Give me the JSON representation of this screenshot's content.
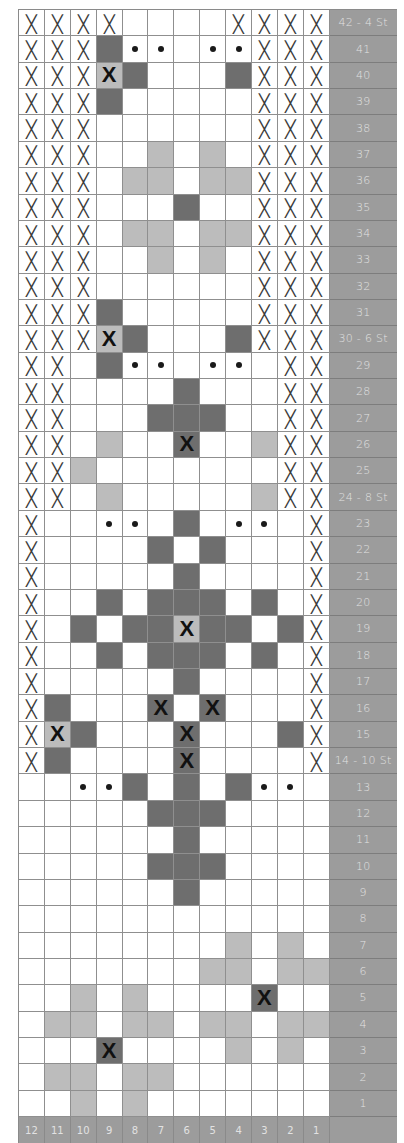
{
  "legend_key": {
    ".": "empty",
    "X": "no-stitch",
    "D": "dark-stitch",
    "L": "light-stitch",
    "o": "dot-stitch",
    "K": "light-stitch-bold-x",
    "B": "dark-stitch-bold-x"
  },
  "colors": {
    "dark": "#6e6e6e",
    "light": "#bcbcbc",
    "label_bg": "#9c9c9c",
    "label_text": "#e2e2e2",
    "grid_line": "#8f8f8f"
  },
  "rows": [
    {
      "label": "42 - 4 St",
      "cells": "XXXX....XXXX"
    },
    {
      "label": "41",
      "cells": "XXXDoo.ooXXX"
    },
    {
      "label": "40",
      "cells": "XXXKD...DXXX"
    },
    {
      "label": "39",
      "cells": "XXXD.....XXX"
    },
    {
      "label": "38",
      "cells": "XXX......XXX"
    },
    {
      "label": "37",
      "cells": "XXX..L.L.XXX"
    },
    {
      "label": "36",
      "cells": "XXX.LL.LLXXX"
    },
    {
      "label": "35",
      "cells": "XXX...D..XXX"
    },
    {
      "label": "34",
      "cells": "XXX.LL.LLXXX"
    },
    {
      "label": "33",
      "cells": "XXX..L.L.XXX"
    },
    {
      "label": "32",
      "cells": "XXX......XXX"
    },
    {
      "label": "31",
      "cells": "XXXD.....XXX"
    },
    {
      "label": "30 - 6 St",
      "cells": "XXXKD...DXXX"
    },
    {
      "label": "29",
      "cells": "XX.Doo.oo.XX"
    },
    {
      "label": "28",
      "cells": "XX....D...XX"
    },
    {
      "label": "27",
      "cells": "XX...DDD..XX"
    },
    {
      "label": "26",
      "cells": "XX.L..B..LXX"
    },
    {
      "label": "25",
      "cells": "XXL.......XX"
    },
    {
      "label": "24 - 8 St",
      "cells": "XX.L.....LXX"
    },
    {
      "label": "23",
      "cells": "X..oo.D.oo.X"
    },
    {
      "label": "22",
      "cells": "X....D.D...X"
    },
    {
      "label": "21",
      "cells": "X.....D....X"
    },
    {
      "label": "20",
      "cells": "X..D.DDD.D.X"
    },
    {
      "label": "19",
      "cells": "X.D.DDKDD.DX"
    },
    {
      "label": "18",
      "cells": "X..D.DDD.D.X"
    },
    {
      "label": "17",
      "cells": "X.....D....X"
    },
    {
      "label": "16",
      "cells": "XD...B.B...X"
    },
    {
      "label": "15",
      "cells": "XKD...B...DX"
    },
    {
      "label": "14 - 10 St",
      "cells": "XD....B....X"
    },
    {
      "label": "13",
      "cells": "..ooD.D.Doo."
    },
    {
      "label": "12",
      "cells": ".....DDD...."
    },
    {
      "label": "11",
      "cells": "......D....."
    },
    {
      "label": "10",
      "cells": ".....DDD...."
    },
    {
      "label": "9",
      "cells": "......D....."
    },
    {
      "label": "8",
      "cells": "............"
    },
    {
      "label": "7",
      "cells": "........L.L."
    },
    {
      "label": "6",
      "cells": ".......LL.LL"
    },
    {
      "label": "5",
      "cells": "..L.L....B.."
    },
    {
      "label": "4",
      "cells": ".LL.LL.LL.LL"
    },
    {
      "label": "3",
      "cells": "...B....L.L."
    },
    {
      "label": "2",
      "cells": ".LL.LL......"
    },
    {
      "label": "1",
      "cells": "..L.L......."
    }
  ],
  "column_numbers": [
    "12",
    "11",
    "10",
    "9",
    "8",
    "7",
    "6",
    "5",
    "4",
    "3",
    "2",
    "1"
  ]
}
